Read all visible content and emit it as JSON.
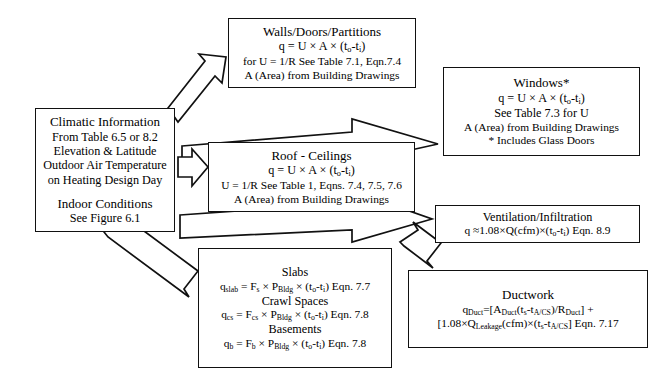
{
  "diagram": {
    "colors": {
      "stroke": "#111111",
      "fill": "#ffffff",
      "text": "#000000"
    }
  },
  "boxes": {
    "climatic": {
      "name": "Climatic Information",
      "lines": [
        "Climatic Information",
        "From Table 6.5 or 8.2",
        "Elevation & Latitude",
        "Outdoor Air Temperature",
        "on Heating Design Day",
        "Indoor Conditions",
        "See Figure 6.1"
      ]
    },
    "walls": {
      "name": "Walls/Doors/Partitions",
      "lines": [
        "Walls/Doors/Partitions",
        "q = U × A × (to-ti)",
        "for U = 1/R See Table 7.1, Eqn.7.4",
        "A (Area) from Building Drawings"
      ]
    },
    "windows": {
      "name": "Windows*",
      "lines": [
        "Windows*",
        "q = U × A × (to-ti)",
        "See Table 7.3 for U",
        "A (Area) from Building Drawings",
        "* Includes Glass Doors"
      ]
    },
    "roof": {
      "name": "Roof - Ceilings",
      "lines": [
        "Roof - Ceilings",
        "q = U × A × (to-ti)",
        "U = 1/R See Table 1, Eqns. 7.4, 7.5, 7.6",
        "A (Area) from Building Drawings"
      ]
    },
    "ventilation": {
      "name": "Ventilation/Infiltration",
      "lines": [
        "Ventilation/Infiltration",
        "q ≈1.08×Q(cfm)×(to-ti) Eqn. 8.9"
      ]
    },
    "slabs": {
      "name": "Slabs / Crawl Spaces / Basements",
      "lines": [
        "Slabs",
        "qslab = Fs × PBldg × (to-ti) Eqn. 7.7",
        "Crawl Spaces",
        "qcs = Fcs × PBldg × (to-ti) Eqn. 7.8",
        "Basements",
        "qb = Fb × PBldg × (to-ti) Eqn. 7.8"
      ]
    },
    "ductwork": {
      "name": "Ductwork",
      "lines": [
        "Ductwork",
        "qDuct=[ADuct(ts-tA/CS)/RDuct] +",
        "[1.08×QLeakage(cfm)×(ts-tA/CS] Eqn. 7.17"
      ]
    }
  },
  "arrows": [
    {
      "name": "arrow-climatic-to-walls",
      "from": "climatic",
      "to": "walls"
    },
    {
      "name": "arrow-climatic-to-windows",
      "from": "climatic",
      "to": "windows"
    },
    {
      "name": "arrow-climatic-to-roof",
      "from": "climatic",
      "to": "roof"
    },
    {
      "name": "arrow-climatic-to-ventilation",
      "from": "climatic",
      "to": "ventilation"
    },
    {
      "name": "arrow-climatic-to-slabs",
      "from": "climatic",
      "to": "slabs"
    },
    {
      "name": "arrow-ventilation-to-ductwork",
      "from": "ventilation",
      "to": "ductwork"
    }
  ]
}
